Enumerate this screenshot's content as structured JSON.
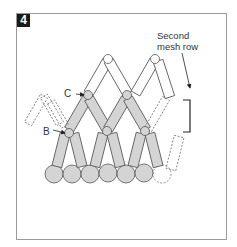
{
  "figure": {
    "step_number": "4",
    "caption_line1": "Second",
    "caption_line2": "mesh row",
    "labels": {
      "b": "B",
      "c": "C"
    }
  },
  "colors": {
    "bead_fill": "#d4d4d4",
    "bead_stroke": "#555555",
    "outline": "#444444",
    "badge_bg": "#1a1a1a",
    "frame": "#9a9a9a"
  }
}
